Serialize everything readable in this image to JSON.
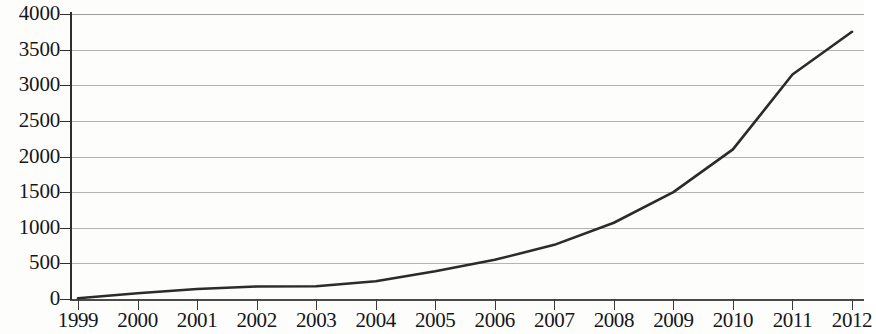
{
  "chart_data": {
    "type": "line",
    "title": "",
    "subtitle": "",
    "xlabel": "",
    "ylabel": "",
    "grid": true,
    "legend": false,
    "legend_position": "none",
    "line_color": "#2b2b2b",
    "grid_color": "#b3b3b0",
    "axis_color": "#2e2e2e",
    "background_color": "#fdfdfb",
    "xlim": [
      1999,
      2012
    ],
    "ylim": [
      0,
      4000
    ],
    "y_ticks": [
      0,
      500,
      1000,
      1500,
      2000,
      2500,
      3000,
      3500,
      4000
    ],
    "y_tick_labels": [
      "0",
      "500",
      "1000",
      "1500",
      "2000",
      "2500",
      "3000",
      "3500",
      "4000"
    ],
    "categories": [
      1999,
      2000,
      2001,
      2002,
      2003,
      2004,
      2005,
      2006,
      2007,
      2008,
      2009,
      2010,
      2011,
      2012
    ],
    "x_tick_labels": [
      "1999",
      "2000",
      "2001",
      "2002",
      "2003",
      "2004",
      "2005",
      "2006",
      "2007",
      "2008",
      "2009",
      "2010",
      "2011",
      "2012"
    ],
    "series": [
      {
        "name": "",
        "values": [
          10,
          80,
          140,
          175,
          180,
          250,
          390,
          550,
          760,
          1070,
          1500,
          2100,
          3150,
          3750
        ]
      }
    ]
  }
}
